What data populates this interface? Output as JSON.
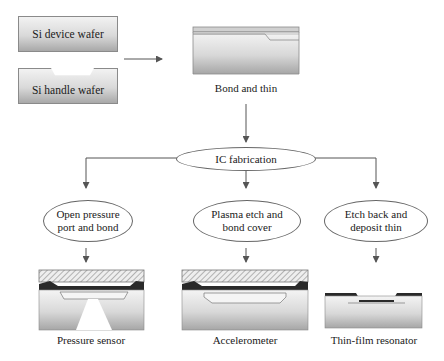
{
  "inputs": {
    "device_wafer": "Si device wafer",
    "handle_wafer": "Si handle wafer"
  },
  "steps": {
    "bond_and_thin": "Bond and thin",
    "ic_fabrication": "IC fabrication"
  },
  "branches": [
    {
      "process_line1": "Open pressure",
      "process_line2": "port and bond",
      "result": "Pressure sensor"
    },
    {
      "process_line1": "Plasma etch and",
      "process_line2": "bond cover",
      "result": "Accelerometer"
    },
    {
      "process_line1": "Etch back and",
      "process_line2": "deposit thin",
      "result": "Thin-film resonator"
    }
  ],
  "colors": {
    "line": "#555555",
    "box_border": "#8a8a8a",
    "dark_layer": "#2a2a2a"
  }
}
